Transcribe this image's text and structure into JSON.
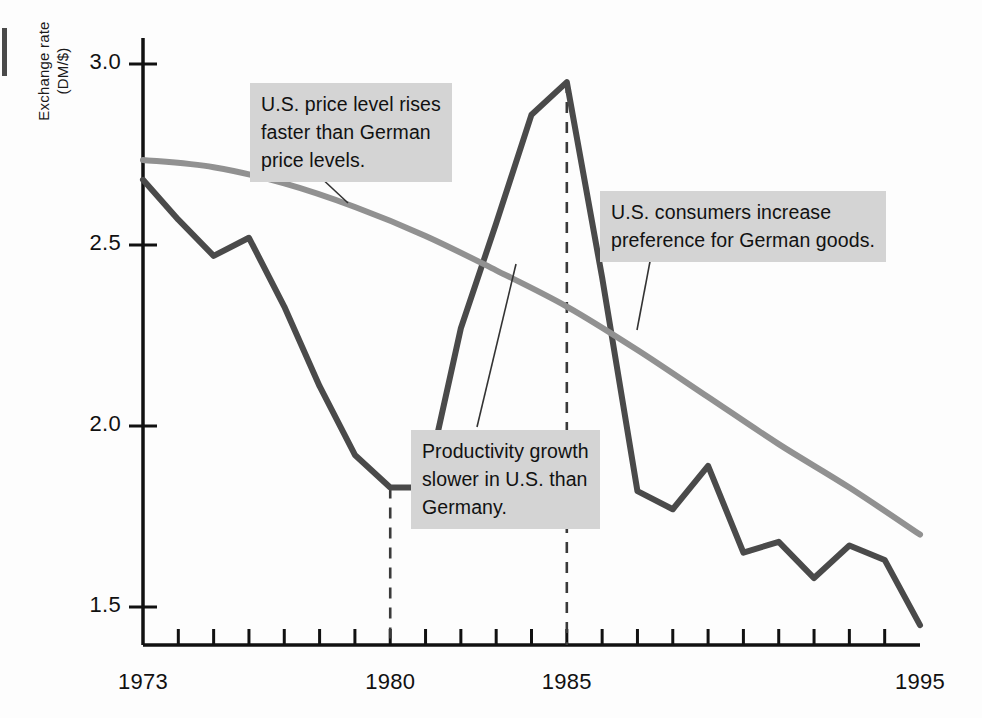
{
  "chart_data": {
    "type": "line",
    "title": "",
    "xlabel": "",
    "ylabel": "Exchange rate (DM/$)",
    "xlim": [
      1973,
      1995
    ],
    "ylim": [
      1.42,
      3.08
    ],
    "grid": false,
    "legend": "none",
    "y_ticks": [
      "3.0",
      "2.5",
      "2.0",
      "1.5"
    ],
    "y_tick_values": [
      3.0,
      2.5,
      2.0,
      1.5
    ],
    "x_ticks": [
      "1973",
      "1980",
      "1985",
      "1995"
    ],
    "x_tick_values": [
      1973,
      1980,
      1985,
      1995
    ],
    "x_minor_tick_years": [
      1974,
      1975,
      1976,
      1977,
      1978,
      1979,
      1981,
      1982,
      1983,
      1984,
      1986,
      1987,
      1988,
      1989,
      1990,
      1991,
      1992,
      1993,
      1994
    ],
    "series": [
      {
        "name": "Actual exchange rate (DM/$)",
        "style": "solid",
        "color": "#4a4a4a",
        "x": [
          1973,
          1974,
          1975,
          1976,
          1977,
          1978,
          1979,
          1980,
          1981,
          1982,
          1983,
          1984,
          1985,
          1986,
          1987,
          1988,
          1989,
          1990,
          1991,
          1992,
          1993,
          1994,
          1995
        ],
        "values": [
          2.68,
          2.57,
          2.47,
          2.52,
          2.33,
          2.11,
          1.92,
          1.83,
          1.83,
          2.27,
          2.56,
          2.86,
          2.95,
          2.41,
          1.82,
          1.77,
          1.89,
          1.65,
          1.68,
          1.58,
          1.67,
          1.63,
          1.45
        ]
      },
      {
        "name": "Purchasing power parity trend",
        "style": "solid-smooth",
        "color": "#919191",
        "x": [
          1973,
          1975,
          1977,
          1979,
          1981,
          1983,
          1985,
          1987,
          1989,
          1991,
          1993,
          1995
        ],
        "values": [
          2.735,
          2.715,
          2.67,
          2.605,
          2.525,
          2.43,
          2.33,
          2.21,
          2.08,
          1.95,
          1.83,
          1.7
        ]
      }
    ],
    "reference_lines": [
      {
        "name": "dashed-1980",
        "x": 1980,
        "style": "dashed",
        "y_top": 1.83,
        "y_bottom": 1.42
      },
      {
        "name": "dashed-1985",
        "x": 1985,
        "style": "dashed",
        "y_top": 2.95,
        "y_bottom": 1.42
      }
    ],
    "annotations": [
      {
        "id": "annotation-price-level",
        "text": "U.S. price level rises\nfaster than German\nprice levels.",
        "box_left": 250,
        "box_top": 83,
        "leader_from_x": 318,
        "leader_from_y": 175,
        "leader_to_x": 348,
        "leader_to_y": 203
      },
      {
        "id": "annotation-consumer-preference",
        "text": "U.S. consumers increase\npreference for German goods.",
        "box_left": 600,
        "box_top": 191,
        "leader_from_x": 652,
        "leader_from_y": 251,
        "leader_to_x": 637,
        "leader_to_y": 330
      },
      {
        "id": "annotation-productivity",
        "text": "Productivity growth\nslower in U.S. than\nGermany.",
        "box_left": 411,
        "box_top": 430,
        "leader_from_x": 516,
        "leader_from_y": 264,
        "leader_to_x": 477,
        "leader_to_y": 427
      }
    ]
  }
}
